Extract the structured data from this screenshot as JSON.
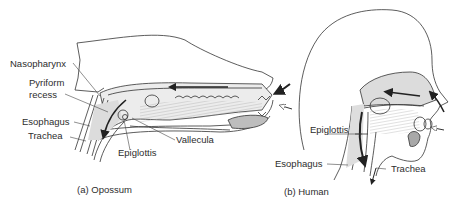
{
  "figure": {
    "panels": [
      {
        "id": "a",
        "caption": "(a) Opossum",
        "labels": {
          "nasopharynx": "Nasopharynx",
          "pyriform_recess_1": "Pyriform",
          "pyriform_recess_2": "recess",
          "esophagus": "Esophagus",
          "trachea": "Trachea",
          "epiglottis": "Epiglottis",
          "vallecula": "Vallecula"
        }
      },
      {
        "id": "b",
        "caption": "(b) Human",
        "labels": {
          "epiglottis": "Epiglottis",
          "esophagus": "Esophagus",
          "trachea": "Trachea"
        }
      }
    ],
    "colors": {
      "line": "#333333",
      "shade": "#cfcfcf",
      "dark_shade": "#a8a8a8",
      "background": "#ffffff"
    }
  }
}
